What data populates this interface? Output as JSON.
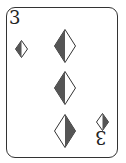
{
  "card": {
    "rank": "3",
    "suit": "diamonds",
    "suit_icon": "diamond-icon",
    "pip_count": 3,
    "colors": {
      "fill": "#555555",
      "outline": "#333333",
      "background": "#ffffff"
    }
  }
}
